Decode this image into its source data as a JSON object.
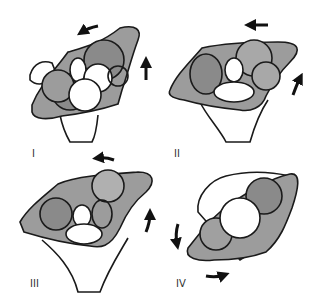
{
  "figure": {
    "panels": [
      {
        "id": "I",
        "label": "I",
        "rotation_arrows": [
          "top-counterclockwise",
          "right-upward"
        ]
      },
      {
        "id": "II",
        "label": "II",
        "rotation_arrows": [
          "top-leftward",
          "right-upward"
        ]
      },
      {
        "id": "III",
        "label": "III",
        "rotation_arrows": [
          "top-leftward",
          "right-upward"
        ]
      },
      {
        "id": "IV",
        "label": "IV",
        "rotation_arrows": [
          "left-downward",
          "bottom-rightward"
        ]
      }
    ],
    "colors": {
      "stroke": "#1a1a1a",
      "fill_shaded": "#9c9c9c",
      "fill_dark": "#848484",
      "background": "#ffffff"
    }
  }
}
